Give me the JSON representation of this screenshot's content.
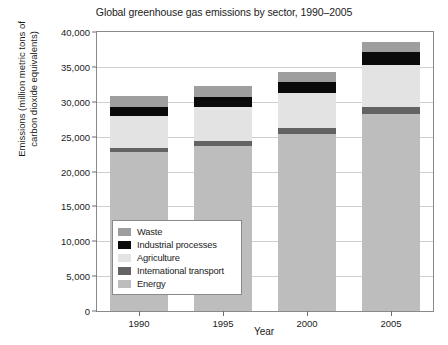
{
  "chart_data": {
    "type": "bar",
    "stacked": true,
    "title": "Global greenhouse gas emissions by sector, 1990–2005",
    "xlabel": "Year",
    "ylabel": "Emissions (million metric tons of\ncarbon dioxide equivalents)",
    "categories": [
      "1990",
      "1995",
      "2000",
      "2005"
    ],
    "ylim": [
      0,
      40000
    ],
    "ytick_values": [
      0,
      5000,
      10000,
      15000,
      20000,
      25000,
      30000,
      35000,
      40000
    ],
    "ytick_labels": [
      "0",
      "5,000",
      "10,000",
      "15,000",
      "20,000",
      "25,000",
      "30,000",
      "35,000",
      "40,000"
    ],
    "grid": true,
    "legend_position": "lower-left-inside",
    "series": [
      {
        "name": "Energy",
        "color": "#bdbdbd",
        "values": [
          22800,
          23700,
          25400,
          28300
        ]
      },
      {
        "name": "International transport",
        "color": "#636363",
        "values": [
          600,
          700,
          800,
          900
        ]
      },
      {
        "name": "Agriculture",
        "color": "#e3e3e3",
        "values": [
          4600,
          4900,
          5000,
          6000
        ]
      },
      {
        "name": "Industrial processes",
        "color": "#0a0a0a",
        "values": [
          1300,
          1400,
          1600,
          1900
        ]
      },
      {
        "name": "Waste",
        "color": "#9e9e9e",
        "values": [
          1500,
          1500,
          1400,
          1500
        ]
      }
    ],
    "legend_order": [
      "Waste",
      "Industrial processes",
      "Agriculture",
      "International transport",
      "Energy"
    ],
    "totals": [
      30800,
      32200,
      34200,
      38600
    ]
  },
  "legend": {
    "items": [
      {
        "label": "Waste",
        "color": "#9e9e9e"
      },
      {
        "label": "Industrial processes",
        "color": "#0a0a0a"
      },
      {
        "label": "Agriculture",
        "color": "#e3e3e3"
      },
      {
        "label": "International transport",
        "color": "#636363"
      },
      {
        "label": "Energy",
        "color": "#bdbdbd"
      }
    ]
  },
  "axes": {
    "frame_color": "#8a8a8a",
    "grid_color": "#cfcfcf",
    "tick_color": "#6f6f6f",
    "text_color": "#1c1c1c"
  }
}
